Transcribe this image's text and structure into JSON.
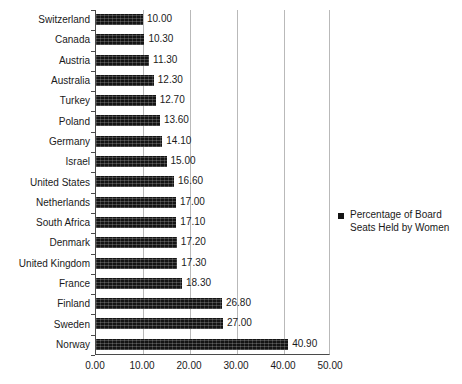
{
  "chart_data": {
    "type": "bar",
    "orientation": "horizontal",
    "title": "",
    "subtitle": "",
    "xlabel": "",
    "ylabel": "",
    "xlim": [
      0,
      50
    ],
    "xticks": [
      "0.00",
      "10.00",
      "20.00",
      "30.00",
      "40.00",
      "50.00"
    ],
    "xtick_values": [
      0,
      10,
      20,
      30,
      40,
      50
    ],
    "grid": true,
    "grid_axis": "x",
    "legend_position": "right",
    "legend": [
      "Percentage of Board Seats Held by Women"
    ],
    "series": [
      {
        "name": "Percentage of Board Seats Held by Women",
        "color": "#141414",
        "values": [
          10.0,
          10.3,
          11.3,
          12.3,
          12.7,
          13.6,
          14.1,
          15.0,
          16.6,
          17.0,
          17.1,
          17.2,
          17.3,
          18.3,
          26.8,
          27.0,
          40.9
        ]
      }
    ],
    "categories": [
      "Switzerland",
      "Canada",
      "Austria",
      "Australia",
      "Turkey",
      "Poland",
      "Germany",
      "Israel",
      "United States",
      "Netherlands",
      "South Africa",
      "Denmark",
      "United Kingdom",
      "France",
      "Finland",
      "Sweden",
      "Norway"
    ],
    "data_labels": [
      "10.00",
      "10.30",
      "11.30",
      "12.30",
      "12.70",
      "13.60",
      "14.10",
      "15.00",
      "16.60",
      "17.00",
      "17.10",
      "17.20",
      "17.30",
      "18.30",
      "26.80",
      "27.00",
      "40.90"
    ]
  },
  "legend": {
    "marker_color": "#141414",
    "label": "Percentage of Board Seats Held by Women"
  },
  "axis": {
    "tick_labels": [
      "0.00",
      "10.00",
      "20.00",
      "30.00",
      "40.00",
      "50.00"
    ]
  }
}
